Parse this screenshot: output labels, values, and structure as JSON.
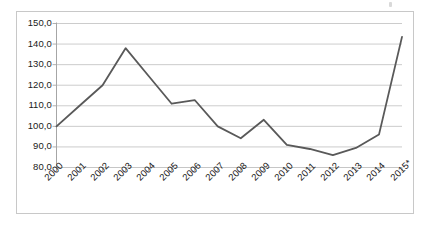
{
  "chart_data": {
    "type": "line",
    "title": "",
    "subtitle": "",
    "xlabel": "",
    "ylabel": "",
    "categories": [
      "2000",
      "2001",
      "2002",
      "2003",
      "2004",
      "2005",
      "2006",
      "2007",
      "2008",
      "2009",
      "2010",
      "2011",
      "2012",
      "2013",
      "2014",
      "2015*"
    ],
    "values": [
      100.0,
      110.0,
      120.0,
      138.0,
      124.5,
      111.0,
      112.8,
      100.0,
      94.2,
      103.2,
      91.0,
      89.0,
      86.0,
      89.5,
      96.0,
      143.5
    ],
    "series": [
      {
        "name": "",
        "values": [
          100.0,
          110.0,
          120.0,
          138.0,
          124.5,
          111.0,
          112.8,
          100.0,
          94.2,
          103.2,
          91.0,
          89.0,
          86.0,
          89.5,
          96.0,
          143.5
        ]
      }
    ],
    "ylim": [
      80.0,
      150.0
    ],
    "ytick_values": [
      150.0,
      140.0,
      130.0,
      120.0,
      110.0,
      100.0,
      90.0,
      80.0
    ],
    "ytick_labels": [
      "150,0",
      "140,0",
      "130,0",
      "120,0",
      "110,0",
      "100,0",
      "90,0",
      "80,0"
    ],
    "xtick_labels": [
      "2000",
      "2001",
      "2002",
      "2003",
      "2004",
      "2005",
      "2006",
      "2007",
      "2008",
      "2009",
      "2010",
      "2011",
      "2012",
      "2013",
      "2014",
      "2015*"
    ],
    "grid": true,
    "grid_axis": "y",
    "legend": false,
    "legend_position": "none",
    "annotations": [],
    "footnote": "",
    "colors": {
      "line": "#595959",
      "gridline": "#bfbfbf",
      "axis": "#a6a6a6",
      "border": "#c8c8c8",
      "text": "#1a1a1a",
      "background": "#ffffff"
    },
    "line_width": 1.8
  }
}
